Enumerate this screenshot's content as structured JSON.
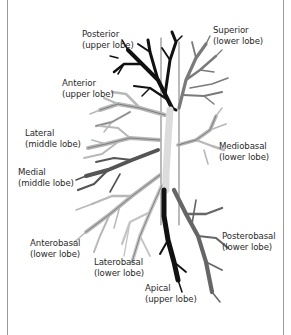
{
  "diagram": {
    "type": "bronchial-tree-segments",
    "colors": {
      "background": "#ffffff",
      "frame": "#9a9a9a",
      "black_segment": "#111111",
      "dark_gray_segment": "#555555",
      "mid_gray_segment": "#7a7a7a",
      "light_gray_segment": "#b8b8b8",
      "outline": "#3a3a3a",
      "label_text": "#2a2a2a"
    },
    "labels": [
      {
        "id": "posterior-upper",
        "name": "Posterior",
        "lobe": "(upper lobe)"
      },
      {
        "id": "superior-lower",
        "name": "Superior",
        "lobe": "(lower lobe)"
      },
      {
        "id": "anterior-upper",
        "name": "Anterior",
        "lobe": "(upper lobe)"
      },
      {
        "id": "lateral-middle",
        "name": "Lateral",
        "lobe": "(middle lobe)"
      },
      {
        "id": "mediobasal-lower",
        "name": "Mediobasal",
        "lobe": "(lower lobe)"
      },
      {
        "id": "medial-middle",
        "name": "Medial",
        "lobe": "(middle lobe)"
      },
      {
        "id": "posterobasal-lower",
        "name": "Posterobasal",
        "lobe": "(lower lobe)"
      },
      {
        "id": "anterobasal-lower",
        "name": "Anterobasal",
        "lobe": "(lower lobe)"
      },
      {
        "id": "laterobasal-lower",
        "name": "Laterobasal",
        "lobe": "(lower lobe)"
      },
      {
        "id": "apical-upper",
        "name": "Apical",
        "lobe": "(upper lobe)"
      }
    ]
  }
}
